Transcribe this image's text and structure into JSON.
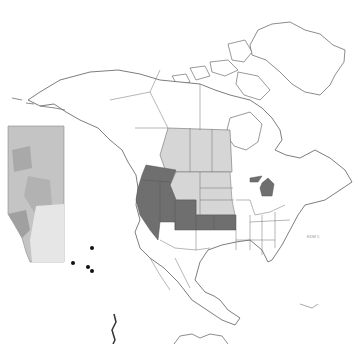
{
  "map": {
    "type": "range-map",
    "region": "North America",
    "colors": {
      "background": "#ffffff",
      "outline": "#6e6e6e",
      "range_dark": "#6f6f6f",
      "range_light": "#d6d6d6",
      "inset_base": "#c4c4c4",
      "inset_light": "#e6e6e6",
      "points": "#111111"
    },
    "dark_range_regions": [
      "Washington",
      "Oregon",
      "Idaho",
      "Nevada",
      "Utah",
      "Colorado",
      "Kansas",
      "Michigan"
    ],
    "light_range_regions": [
      "Alberta",
      "Saskatchewan",
      "Manitoba",
      "Montana",
      "Wyoming",
      "North Dakota",
      "South Dakota",
      "Nebraska"
    ],
    "inset": {
      "region": "Alberta",
      "occurrence_points": 4
    },
    "credit_text": "EDM 5"
  }
}
